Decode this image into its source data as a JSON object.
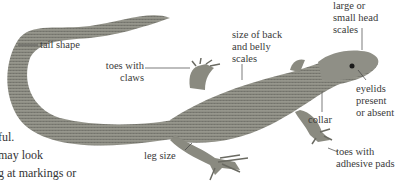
{
  "figure": {
    "labels": {
      "tail_shape": "tail shape",
      "toes_with_claws": [
        "toes with",
        "claws"
      ],
      "size_of_scales": [
        "size of back",
        "and belly",
        "scales"
      ],
      "head_scales": [
        "large or",
        "small head",
        "scales"
      ],
      "eyelids": [
        "eyelids",
        "present",
        "or absent"
      ],
      "collar": "collar",
      "leg_size": "leg size",
      "toes_with_pads": [
        "toes with",
        "adhesive pads"
      ]
    },
    "colors": {
      "lizard_body": "#8a8a80",
      "lizard_dark": "#5e5e57",
      "lizard_light": "#b5b5ab",
      "leader_line": "#444444",
      "label_text": "#3a3a3a"
    }
  },
  "body_text": {
    "lines": [
      "ful.",
      "may look",
      "g at markings or"
    ]
  }
}
